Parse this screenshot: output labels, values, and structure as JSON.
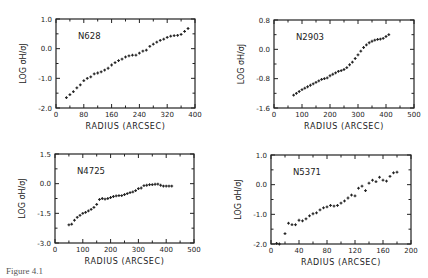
{
  "figure": {
    "caption": "Figure 4.1",
    "ink_color": "#222222",
    "background": "#ffffff"
  },
  "chart_data": [
    {
      "type": "scatter",
      "title": "N628",
      "xlabel": "RADIUS (ARCSEC)",
      "ylabel": "LOG σH/σJ",
      "xlim": [
        0,
        400
      ],
      "ylim": [
        -2.0,
        1.0
      ],
      "xticks": [
        0,
        80,
        160,
        240,
        320,
        400
      ],
      "yticks": [
        1.0,
        0.0,
        -1.0,
        -2.0
      ],
      "ytick_labels": [
        "1.0",
        "0.0",
        "-1.0",
        "-2.0"
      ],
      "box": {
        "x0": 56,
        "y0": 19,
        "x1": 195,
        "y1": 108
      },
      "x": [
        30,
        40,
        50,
        60,
        70,
        80,
        90,
        100,
        110,
        120,
        130,
        140,
        150,
        160,
        170,
        180,
        190,
        200,
        210,
        220,
        230,
        240,
        250,
        260,
        270,
        280,
        290,
        300,
        310,
        320,
        330,
        340,
        350,
        360,
        370,
        380
      ],
      "y": [
        -1.65,
        -1.55,
        -1.45,
        -1.32,
        -1.22,
        -1.08,
        -1.0,
        -0.95,
        -0.85,
        -0.82,
        -0.78,
        -0.72,
        -0.66,
        -0.55,
        -0.47,
        -0.4,
        -0.35,
        -0.28,
        -0.24,
        -0.22,
        -0.22,
        -0.15,
        -0.08,
        -0.05,
        0.08,
        0.15,
        0.22,
        0.28,
        0.32,
        0.38,
        0.42,
        0.44,
        0.45,
        0.48,
        0.58,
        0.68
      ]
    },
    {
      "type": "scatter",
      "title": "N2903",
      "xlabel": "RADIUS (ARCSEC)",
      "ylabel": "LOG σH/σJ",
      "xlim": [
        0,
        500
      ],
      "ylim": [
        -1.6,
        0.8
      ],
      "xticks": [
        0,
        100,
        200,
        300,
        400,
        500
      ],
      "yticks": [
        0.8,
        0.0,
        -0.8,
        -1.6
      ],
      "ytick_labels": [
        "0.8",
        "0.0",
        "-0.8",
        "-1.6"
      ],
      "box": {
        "x0": 274,
        "y0": 20,
        "x1": 414,
        "y1": 108
      },
      "x": [
        70,
        80,
        90,
        100,
        110,
        120,
        130,
        140,
        150,
        160,
        170,
        180,
        190,
        200,
        210,
        220,
        230,
        240,
        250,
        260,
        270,
        280,
        290,
        300,
        310,
        320,
        330,
        340,
        350,
        360,
        370,
        380,
        390,
        400,
        410
      ],
      "y": [
        -1.25,
        -1.2,
        -1.15,
        -1.1,
        -1.06,
        -1.02,
        -0.98,
        -0.94,
        -0.9,
        -0.86,
        -0.82,
        -0.8,
        -0.78,
        -0.72,
        -0.68,
        -0.64,
        -0.6,
        -0.58,
        -0.55,
        -0.5,
        -0.42,
        -0.35,
        -0.25,
        -0.15,
        -0.05,
        0.05,
        0.12,
        0.18,
        0.22,
        0.25,
        0.27,
        0.28,
        0.3,
        0.35,
        0.4
      ]
    },
    {
      "type": "scatter",
      "title": "N4725",
      "xlabel": "RADIUS (ARCSEC)",
      "ylabel": "LOG σH/σJ",
      "xlim": [
        0,
        500
      ],
      "ylim": [
        -3.0,
        1.5
      ],
      "xticks": [
        0,
        100,
        200,
        300,
        400,
        500
      ],
      "yticks": [
        1.5,
        0.0,
        -1.5,
        -3.0
      ],
      "ytick_labels": [
        "1.5",
        "0.0",
        "-1.5",
        "-3.0"
      ],
      "box": {
        "x0": 55,
        "y0": 154,
        "x1": 194,
        "y1": 243
      },
      "x": [
        50,
        60,
        70,
        80,
        90,
        100,
        110,
        120,
        130,
        140,
        150,
        160,
        170,
        180,
        190,
        200,
        210,
        220,
        230,
        240,
        250,
        260,
        270,
        280,
        290,
        300,
        310,
        320,
        330,
        340,
        350,
        360,
        370,
        380,
        390,
        400,
        410,
        420
      ],
      "y": [
        -2.08,
        -2.05,
        -1.85,
        -1.7,
        -1.6,
        -1.5,
        -1.45,
        -1.38,
        -1.3,
        -1.2,
        -1.05,
        -0.8,
        -0.75,
        -0.78,
        -0.75,
        -0.7,
        -0.65,
        -0.62,
        -0.6,
        -0.6,
        -0.55,
        -0.5,
        -0.45,
        -0.42,
        -0.35,
        -0.25,
        -0.22,
        -0.1,
        -0.08,
        -0.05,
        -0.05,
        -0.03,
        -0.02,
        -0.08,
        -0.12,
        -0.12,
        -0.12,
        -0.12
      ]
    },
    {
      "type": "scatter",
      "title": "N5371",
      "xlabel": "RADIUS (ARCSEC)",
      "ylabel": "LOG σH/σJ",
      "xlim": [
        0,
        200
      ],
      "ylim": [
        -2.0,
        1.0
      ],
      "xticks": [
        0,
        40,
        80,
        120,
        160,
        200
      ],
      "yticks": [
        1.0,
        0.0,
        -1.0,
        -2.0
      ],
      "ytick_labels": [
        "1.0",
        "0.0",
        "-1.0",
        "-2.0"
      ],
      "box": {
        "x0": 271,
        "y0": 155,
        "x1": 411,
        "y1": 244
      },
      "x": [
        8,
        12,
        20,
        25,
        30,
        35,
        40,
        45,
        50,
        55,
        60,
        65,
        70,
        75,
        80,
        85,
        90,
        95,
        100,
        105,
        110,
        115,
        120,
        125,
        130,
        135,
        140,
        145,
        150,
        155,
        160,
        165,
        170,
        175,
        180
      ],
      "y": [
        -1.98,
        -2.0,
        -1.65,
        -1.3,
        -1.35,
        -1.35,
        -1.2,
        -1.22,
        -1.15,
        -1.05,
        -0.98,
        -0.95,
        -0.85,
        -0.78,
        -0.75,
        -0.7,
        -0.72,
        -0.7,
        -0.62,
        -0.55,
        -0.45,
        -0.35,
        -0.38,
        -0.12,
        -0.05,
        -0.2,
        0.05,
        0.15,
        0.1,
        0.25,
        0.15,
        0.12,
        0.28,
        0.4,
        0.42
      ]
    }
  ]
}
